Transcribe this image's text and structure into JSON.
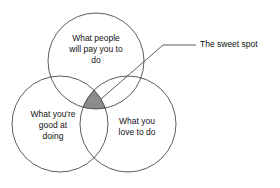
{
  "diagram": {
    "type": "venn",
    "circles": [
      {
        "id": "pay",
        "label": "What people will pay you to do",
        "lines": [
          "What people",
          "will pay you to",
          "do"
        ]
      },
      {
        "id": "good",
        "label": "What you're good at doing",
        "lines": [
          "What you're",
          "good at",
          "doing"
        ]
      },
      {
        "id": "love",
        "label": "What you love to do",
        "lines": [
          "What you",
          "love to do"
        ]
      }
    ],
    "intersection": {
      "label": "The sweet spot",
      "fill": "#8c8c8c"
    },
    "stroke_color": "#333333"
  }
}
